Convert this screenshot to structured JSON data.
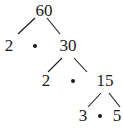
{
  "diagram": {
    "type": "factor-tree",
    "root": "60",
    "nodes": [
      {
        "id": "n60",
        "label": "60",
        "x": 44,
        "y": 10
      },
      {
        "id": "n2a",
        "label": "2",
        "x": 9,
        "y": 45
      },
      {
        "id": "n30",
        "label": "30",
        "x": 68,
        "y": 45
      },
      {
        "id": "n2b",
        "label": "2",
        "x": 46,
        "y": 80
      },
      {
        "id": "n15",
        "label": "15",
        "x": 105,
        "y": 80
      },
      {
        "id": "n3",
        "label": "3",
        "x": 83,
        "y": 115
      },
      {
        "id": "n5",
        "label": "5",
        "x": 117,
        "y": 115
      }
    ],
    "multiplication_dots": [
      {
        "between": [
          "2",
          "30"
        ],
        "x": 35,
        "y": 46
      },
      {
        "between": [
          "2",
          "15"
        ],
        "x": 73,
        "y": 81
      },
      {
        "between": [
          "3",
          "5"
        ],
        "x": 100,
        "y": 116
      }
    ],
    "edges": [
      {
        "from": "60",
        "to": "2",
        "x1": 35,
        "y1": 18,
        "x2": 18,
        "y2": 34
      },
      {
        "from": "60",
        "to": "30",
        "x1": 47,
        "y1": 18,
        "x2": 60,
        "y2": 34
      },
      {
        "from": "30",
        "to": "2",
        "x1": 62,
        "y1": 58,
        "x2": 48,
        "y2": 72
      },
      {
        "from": "30",
        "to": "15",
        "x1": 74,
        "y1": 58,
        "x2": 87,
        "y2": 72
      },
      {
        "from": "15",
        "to": "3",
        "x1": 101,
        "y1": 93,
        "x2": 88,
        "y2": 107
      },
      {
        "from": "15",
        "to": "5",
        "x1": 109,
        "y1": 93,
        "x2": 120,
        "y2": 107
      }
    ],
    "colors": {
      "ink": "#1a1a1a",
      "background": "#ffffff"
    }
  }
}
